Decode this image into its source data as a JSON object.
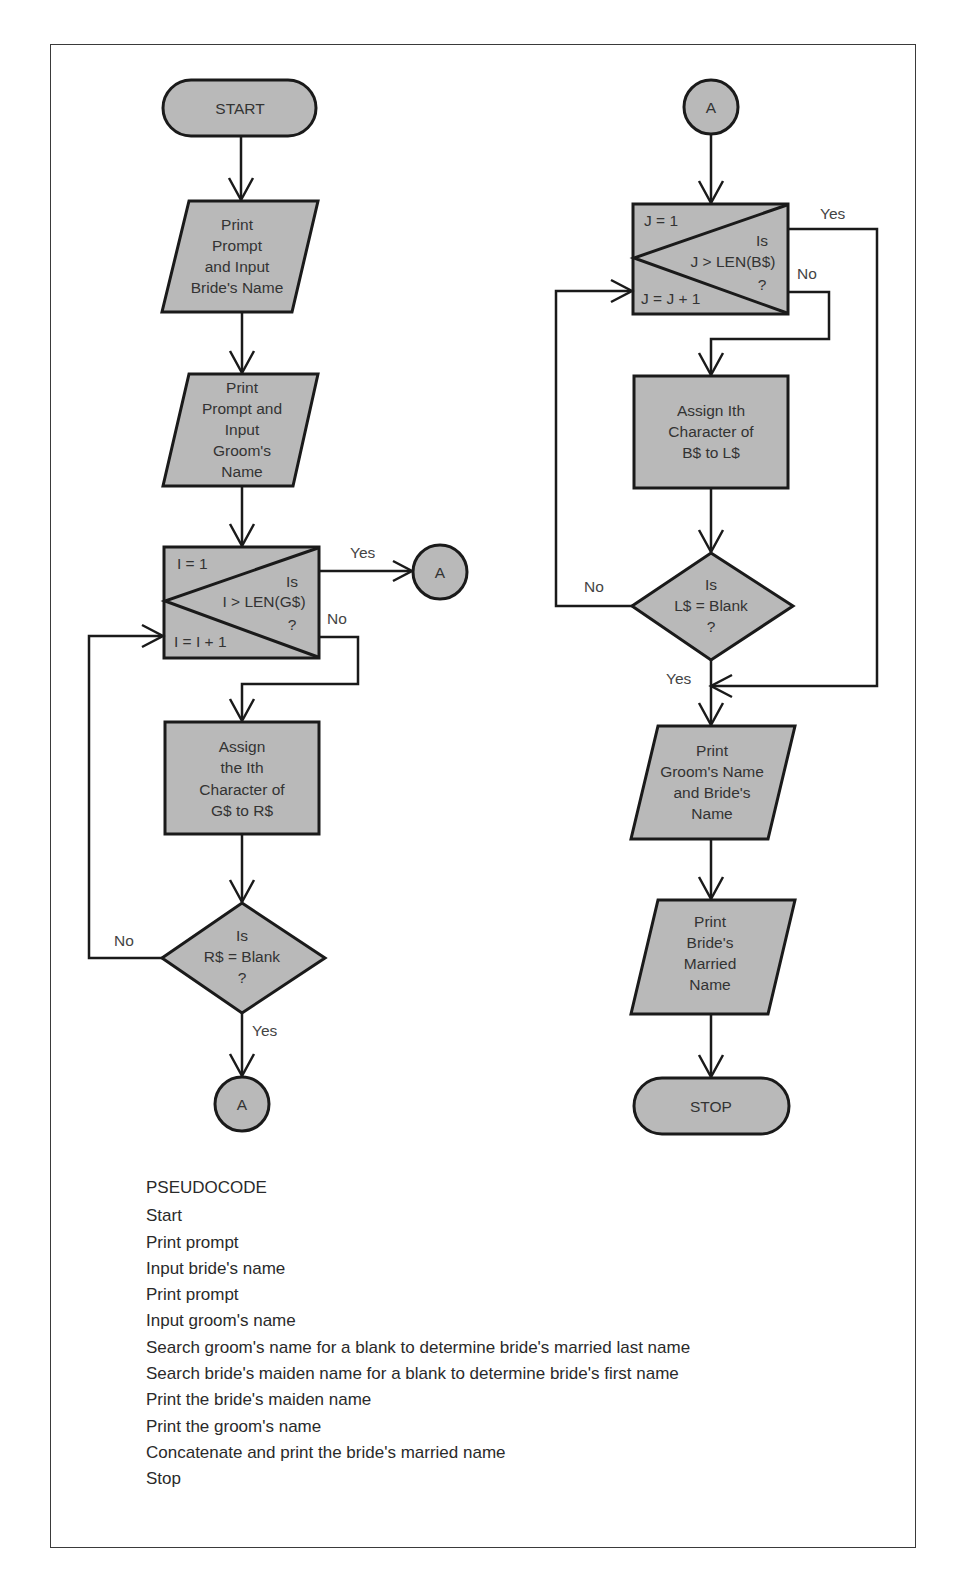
{
  "colors": {
    "shape_fill": "#b9b9b9",
    "stroke": "#1a1a1a",
    "text": "#333333"
  },
  "flowchart_left": {
    "start": "START",
    "input_bride": [
      "Print",
      "Prompt",
      "and Input",
      "Bride's Name"
    ],
    "input_groom": [
      "Print",
      "Prompt and",
      "Input",
      "Groom's",
      "Name"
    ],
    "loop": {
      "init": "I = 1",
      "increment": "I = I + 1",
      "test": [
        "Is",
        "I > LEN(G$)",
        "?"
      ],
      "yes_label": "Yes",
      "no_label": "No"
    },
    "connector_yes": "A",
    "assign": [
      "Assign",
      "the Ith",
      "Character of",
      "G$ to R$"
    ],
    "decision": {
      "text": [
        "Is",
        "R$ = Blank",
        "?"
      ],
      "no_label": "No",
      "yes_label": "Yes"
    },
    "connector_end": "A"
  },
  "flowchart_right": {
    "connector_start": "A",
    "loop": {
      "init": "J = 1",
      "increment": "J = J + 1",
      "test": [
        "Is",
        "J > LEN(B$)",
        "?"
      ],
      "yes_label": "Yes",
      "no_label": "No"
    },
    "assign": [
      "Assign Ith",
      "Character of",
      "B$ to L$"
    ],
    "decision": {
      "text": [
        "Is",
        "L$ = Blank",
        "?"
      ],
      "no_label": "No",
      "yes_label": "Yes"
    },
    "print_names": [
      "Print",
      "Groom's Name",
      "and Bride's",
      "Name"
    ],
    "print_married": [
      "Print",
      "Bride's",
      "Married",
      "Name"
    ],
    "stop": "STOP"
  },
  "pseudocode": {
    "title": "PSEUDOCODE",
    "lines": [
      "Start",
      "Print prompt",
      "Input bride's name",
      "Print prompt",
      "Input groom's name",
      "Search groom's name for a blank to determine bride's married last name",
      "Search bride's maiden name for a blank to determine bride's first name",
      "Print the bride's maiden name",
      "Print the groom's name",
      "Concatenate and print the bride's married name",
      "Stop"
    ]
  }
}
